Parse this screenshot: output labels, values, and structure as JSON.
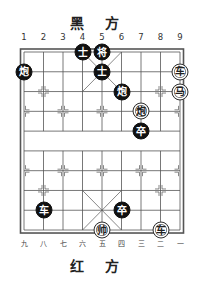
{
  "top_side_label": "黑 方",
  "bottom_side_label": "红 方",
  "top_coords": [
    "1",
    "2",
    "3",
    "4",
    "5",
    "6",
    "7",
    "8",
    "9"
  ],
  "bottom_coords": [
    "九",
    "八",
    "七",
    "六",
    "五",
    "四",
    "三",
    "二",
    "一"
  ],
  "colors": {
    "black_piece": "#111111",
    "red_piece_bg": "#ffffff",
    "line": "#555555"
  },
  "pieces": [
    {
      "side": "black",
      "char": "士",
      "col": 4,
      "row": 0
    },
    {
      "side": "black",
      "char": "将",
      "col": 5,
      "row": 0
    },
    {
      "side": "black",
      "char": "炮",
      "col": 1,
      "row": 1
    },
    {
      "side": "black",
      "char": "士",
      "col": 5,
      "row": 1
    },
    {
      "side": "red",
      "char": "车",
      "col": 9,
      "row": 1
    },
    {
      "side": "black",
      "char": "炮",
      "col": 6,
      "row": 2
    },
    {
      "side": "red",
      "char": "马",
      "col": 9,
      "row": 2
    },
    {
      "side": "red",
      "char": "炮",
      "col": 7,
      "row": 3
    },
    {
      "side": "black",
      "char": "卒",
      "col": 7,
      "row": 4
    },
    {
      "side": "black",
      "char": "车",
      "col": 2,
      "row": 8
    },
    {
      "side": "black",
      "char": "卒",
      "col": 6,
      "row": 8
    },
    {
      "side": "red",
      "char": "帅",
      "col": 5,
      "row": 9
    },
    {
      "side": "red",
      "char": "车",
      "col": 8,
      "row": 9
    }
  ]
}
